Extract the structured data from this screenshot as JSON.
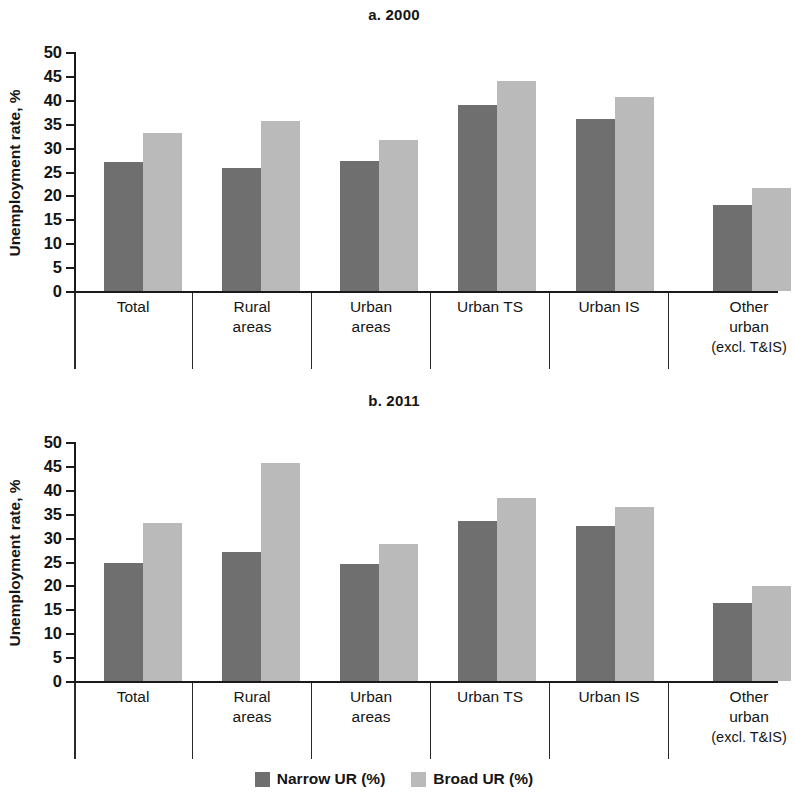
{
  "figure": {
    "ylabel": "Unemployment rate, %",
    "legend": [
      {
        "label": "Narrow UR (%)",
        "color": "#6f6f6f",
        "key": "narrow"
      },
      {
        "label": "Broad UR (%)",
        "color": "#bababa",
        "key": "broad"
      }
    ]
  },
  "panels": [
    {
      "id": "a",
      "title": "a. 2000"
    },
    {
      "id": "b",
      "title": "b. 2011"
    }
  ],
  "categories": [
    {
      "line1": "Total",
      "line2": "",
      "line3": ""
    },
    {
      "line1": "Rural",
      "line2": "areas",
      "line3": ""
    },
    {
      "line1": "Urban",
      "line2": "areas",
      "line3": ""
    },
    {
      "line1": "Urban TS",
      "line2": "",
      "line3": ""
    },
    {
      "line1": "Urban IS",
      "line2": "",
      "line3": ""
    },
    {
      "line1": "Other",
      "line2": "urban",
      "line3": "(excl. T&IS)"
    }
  ],
  "yticks": [
    "0",
    "5",
    "10",
    "15",
    "20",
    "25",
    "30",
    "35",
    "40",
    "45",
    "50"
  ],
  "chart_data": [
    {
      "type": "bar",
      "title": "a. 2000",
      "xlabel": "",
      "ylabel": "Unemployment rate, %",
      "ylim": [
        0,
        50
      ],
      "ytick_step": 5,
      "grid": false,
      "legend_position": "bottom",
      "categories": [
        "Total",
        "Rural areas",
        "Urban areas",
        "Urban TS",
        "Urban IS",
        "Other urban (excl. T&IS)"
      ],
      "series": [
        {
          "name": "Narrow UR (%)",
          "color": "#6f6f6f",
          "values": [
            27.0,
            25.7,
            27.3,
            38.9,
            36.0,
            18.0
          ]
        },
        {
          "name": "Broad UR (%)",
          "color": "#bababa",
          "values": [
            33.0,
            35.5,
            31.5,
            44.0,
            40.6,
            21.5
          ]
        }
      ]
    },
    {
      "type": "bar",
      "title": "b. 2011",
      "xlabel": "",
      "ylabel": "Unemployment rate, %",
      "ylim": [
        0,
        50
      ],
      "ytick_step": 5,
      "grid": false,
      "legend_position": "bottom",
      "categories": [
        "Total",
        "Rural areas",
        "Urban areas",
        "Urban TS",
        "Urban IS",
        "Other urban (excl. T&IS)"
      ],
      "series": [
        {
          "name": "Narrow UR (%)",
          "color": "#6f6f6f",
          "values": [
            24.7,
            26.9,
            24.4,
            33.5,
            32.4,
            16.3
          ]
        },
        {
          "name": "Broad UR (%)",
          "color": "#bababa",
          "values": [
            33.0,
            45.7,
            28.7,
            38.3,
            36.4,
            19.9
          ]
        }
      ]
    }
  ]
}
